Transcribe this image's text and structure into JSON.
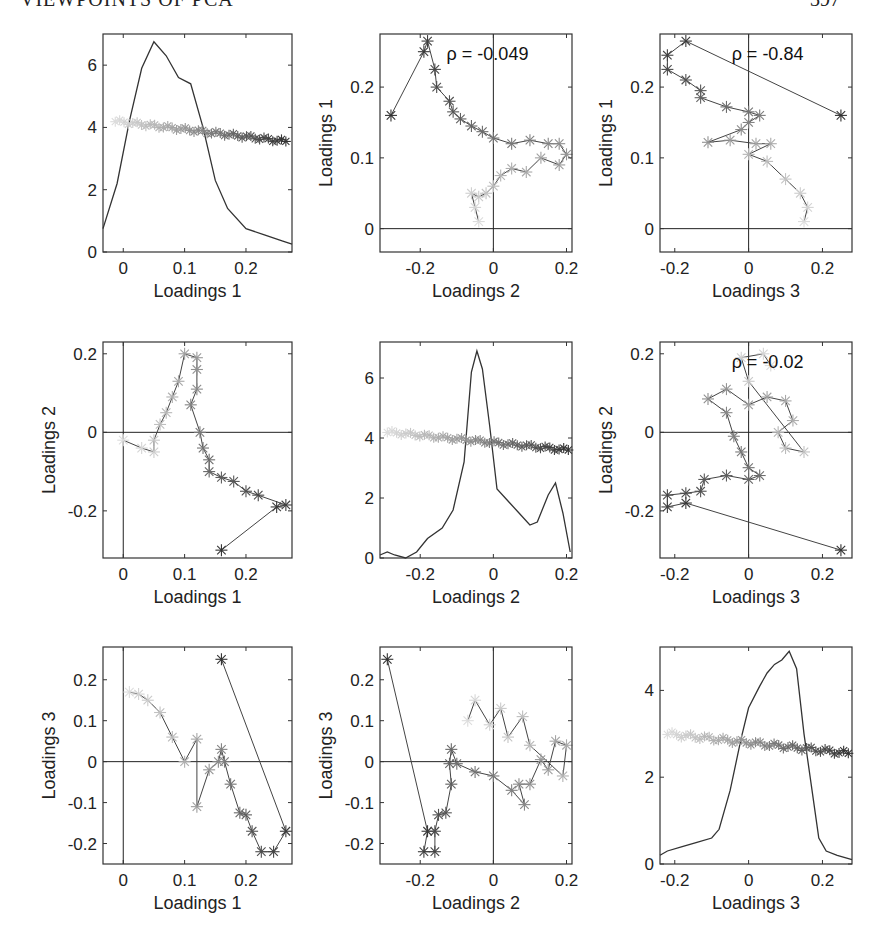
{
  "page": {
    "header": "VIEWPOINTS OF PCA",
    "page_number": "397"
  },
  "chart_data": [
    {
      "id": "p11",
      "type": "line+scatter",
      "title": "",
      "xlabel": "Loadings 1",
      "ylabel": "",
      "xlim": [
        -0.033,
        0.275
      ],
      "ylim": [
        0,
        7
      ],
      "xticks": [
        0,
        0.1,
        0.2
      ],
      "yticks": [
        0,
        2,
        4,
        6
      ],
      "density_curve": {
        "x": [
          -0.033,
          -0.01,
          0.01,
          0.03,
          0.05,
          0.07,
          0.09,
          0.11,
          0.13,
          0.15,
          0.17,
          0.2,
          0.23,
          0.26,
          0.275
        ],
        "y": [
          0.75,
          2.2,
          4.2,
          5.9,
          6.75,
          6.3,
          5.6,
          5.4,
          4.0,
          2.3,
          1.4,
          0.75,
          0.55,
          0.35,
          0.25
        ]
      },
      "trajectory_y_range": [
        3.55,
        4.2
      ],
      "trajectory_x_range": [
        0.0,
        0.27
      ],
      "rho": null
    },
    {
      "id": "p12",
      "type": "scatter",
      "xlabel": "Loadings 2",
      "ylabel": "Loadings 1",
      "xlim": [
        -0.31,
        0.215
      ],
      "ylim": [
        -0.033,
        0.275
      ],
      "xticks": [
        -0.2,
        0,
        0.2
      ],
      "yticks": [
        0,
        0.1,
        0.2
      ],
      "rho_label": "ρ = -0.049",
      "rho": -0.049,
      "points": [
        [
          -0.28,
          0.16
        ],
        [
          -0.19,
          0.25
        ],
        [
          -0.18,
          0.265
        ],
        [
          -0.16,
          0.225
        ],
        [
          -0.155,
          0.2
        ],
        [
          -0.12,
          0.18
        ],
        [
          -0.11,
          0.165
        ],
        [
          -0.09,
          0.155
        ],
        [
          -0.06,
          0.145
        ],
        [
          -0.03,
          0.137
        ],
        [
          0,
          0.128
        ],
        [
          0.05,
          0.12
        ],
        [
          0.1,
          0.125
        ],
        [
          0.15,
          0.12
        ],
        [
          0.18,
          0.12
        ],
        [
          0.2,
          0.105
        ],
        [
          0.18,
          0.09
        ],
        [
          0.13,
          0.1
        ],
        [
          0.09,
          0.08
        ],
        [
          0.05,
          0.085
        ],
        [
          0.02,
          0.075
        ],
        [
          0,
          0.06
        ],
        [
          -0.02,
          0.05
        ],
        [
          -0.04,
          0.045
        ],
        [
          -0.06,
          0.05
        ],
        [
          -0.05,
          0.03
        ],
        [
          -0.04,
          0.01
        ]
      ]
    },
    {
      "id": "p13",
      "type": "scatter",
      "xlabel": "Loadings 3",
      "ylabel": "Loadings 1",
      "xlim": [
        -0.24,
        0.28
      ],
      "ylim": [
        -0.033,
        0.275
      ],
      "xticks": [
        -0.2,
        0,
        0.2
      ],
      "yticks": [
        0,
        0.1,
        0.2
      ],
      "rho_label": "ρ = -0.84",
      "rho": -0.84,
      "points": [
        [
          0.25,
          0.16
        ],
        [
          -0.17,
          0.265
        ],
        [
          -0.22,
          0.245
        ],
        [
          -0.22,
          0.225
        ],
        [
          -0.17,
          0.21
        ],
        [
          -0.13,
          0.195
        ],
        [
          -0.13,
          0.185
        ],
        [
          -0.06,
          0.172
        ],
        [
          0,
          0.165
        ],
        [
          0.03,
          0.16
        ],
        [
          0,
          0.15
        ],
        [
          -0.02,
          0.14
        ],
        [
          -0.11,
          0.122
        ],
        [
          -0.05,
          0.125
        ],
        [
          0.02,
          0.12
        ],
        [
          0.06,
          0.12
        ],
        [
          0,
          0.105
        ],
        [
          0.05,
          0.095
        ],
        [
          0.1,
          0.07
        ],
        [
          0.14,
          0.05
        ],
        [
          0.16,
          0.03
        ],
        [
          0.15,
          0.01
        ]
      ]
    },
    {
      "id": "p21",
      "type": "scatter",
      "xlabel": "Loadings 1",
      "ylabel": "Loadings 2",
      "xlim": [
        -0.033,
        0.275
      ],
      "ylim": [
        -0.32,
        0.23
      ],
      "xticks": [
        0,
        0.1,
        0.2
      ],
      "yticks": [
        -0.2,
        0,
        0.2
      ],
      "points": [
        [
          0.16,
          -0.3
        ],
        [
          0.25,
          -0.19
        ],
        [
          0.265,
          -0.185
        ],
        [
          0.22,
          -0.16
        ],
        [
          0.2,
          -0.15
        ],
        [
          0.18,
          -0.125
        ],
        [
          0.16,
          -0.115
        ],
        [
          0.14,
          -0.1
        ],
        [
          0.14,
          -0.07
        ],
        [
          0.13,
          -0.04
        ],
        [
          0.125,
          0
        ],
        [
          0.11,
          0.07
        ],
        [
          0.12,
          0.11
        ],
        [
          0.12,
          0.16
        ],
        [
          0.12,
          0.19
        ],
        [
          0.1,
          0.2
        ],
        [
          0.09,
          0.13
        ],
        [
          0.08,
          0.09
        ],
        [
          0.07,
          0.05
        ],
        [
          0.06,
          0.02
        ],
        [
          0.05,
          -0.02
        ],
        [
          0.05,
          -0.05
        ],
        [
          0.03,
          -0.04
        ],
        [
          0.0,
          -0.02
        ]
      ]
    },
    {
      "id": "p22",
      "type": "line+scatter",
      "xlabel": "Loadings 2",
      "ylabel": "",
      "xlim": [
        -0.31,
        0.215
      ],
      "ylim": [
        0,
        7.2
      ],
      "xticks": [
        -0.2,
        0,
        0.2
      ],
      "yticks": [
        0,
        2,
        4,
        6
      ],
      "density_curve": {
        "x": [
          -0.31,
          -0.29,
          -0.27,
          -0.24,
          -0.21,
          -0.18,
          -0.14,
          -0.11,
          -0.08,
          -0.06,
          -0.045,
          -0.03,
          -0.01,
          0.01,
          0.04,
          0.07,
          0.1,
          0.12,
          0.15,
          0.17,
          0.19,
          0.21
        ],
        "y": [
          0.1,
          0.2,
          0.1,
          0.0,
          0.2,
          0.65,
          1.0,
          1.6,
          3.2,
          6.2,
          6.9,
          6.3,
          4.4,
          2.3,
          1.9,
          1.5,
          1.1,
          1.2,
          2.1,
          2.5,
          1.5,
          0.2
        ]
      },
      "trajectory_y_range": [
        3.6,
        4.2
      ]
    },
    {
      "id": "p23",
      "type": "scatter",
      "xlabel": "Loadings 3",
      "ylabel": "Loadings 2",
      "xlim": [
        -0.24,
        0.28
      ],
      "ylim": [
        -0.32,
        0.23
      ],
      "xticks": [
        -0.2,
        0,
        0.2
      ],
      "yticks": [
        -0.2,
        0,
        0.2
      ],
      "rho_label": "ρ = -0.02",
      "rho": -0.02,
      "points": [
        [
          0.25,
          -0.3
        ],
        [
          -0.17,
          -0.18
        ],
        [
          -0.22,
          -0.19
        ],
        [
          -0.22,
          -0.16
        ],
        [
          -0.17,
          -0.155
        ],
        [
          -0.13,
          -0.15
        ],
        [
          -0.12,
          -0.12
        ],
        [
          -0.06,
          -0.11
        ],
        [
          0,
          -0.12
        ],
        [
          0.03,
          -0.11
        ],
        [
          0,
          -0.09
        ],
        [
          -0.02,
          -0.05
        ],
        [
          -0.04,
          -0.01
        ],
        [
          -0.06,
          0.05
        ],
        [
          -0.11,
          0.085
        ],
        [
          -0.06,
          0.11
        ],
        [
          0,
          0.07
        ],
        [
          0.05,
          0.09
        ],
        [
          0.1,
          0.08
        ],
        [
          0.12,
          0.03
        ],
        [
          0.08,
          0.0
        ],
        [
          0.1,
          -0.04
        ],
        [
          0.15,
          -0.05
        ],
        [
          0.0,
          0.13
        ],
        [
          -0.02,
          0.19
        ],
        [
          0.04,
          0.2
        ],
        [
          0.06,
          0.17
        ]
      ]
    },
    {
      "id": "p31",
      "type": "scatter",
      "xlabel": "Loadings 1",
      "ylabel": "Loadings 3",
      "xlim": [
        -0.033,
        0.275
      ],
      "ylim": [
        -0.25,
        0.28
      ],
      "xticks": [
        0,
        0.1,
        0.2
      ],
      "yticks": [
        -0.2,
        -0.1,
        0,
        0.1,
        0.2
      ],
      "points": [
        [
          0.16,
          0.25
        ],
        [
          0.265,
          -0.17
        ],
        [
          0.245,
          -0.22
        ],
        [
          0.225,
          -0.22
        ],
        [
          0.21,
          -0.17
        ],
        [
          0.2,
          -0.13
        ],
        [
          0.19,
          -0.125
        ],
        [
          0.175,
          -0.055
        ],
        [
          0.165,
          0
        ],
        [
          0.16,
          0.03
        ],
        [
          0.155,
          0
        ],
        [
          0.14,
          -0.02
        ],
        [
          0.12,
          -0.11
        ],
        [
          0.12,
          0.055
        ],
        [
          0.1,
          0.0
        ],
        [
          0.08,
          0.06
        ],
        [
          0.06,
          0.12
        ],
        [
          0.04,
          0.15
        ],
        [
          0.025,
          0.165
        ],
        [
          0.01,
          0.17
        ]
      ]
    },
    {
      "id": "p32",
      "type": "scatter",
      "xlabel": "Loadings 2",
      "ylabel": "Loadings 3",
      "xlim": [
        -0.31,
        0.215
      ],
      "ylim": [
        -0.25,
        0.28
      ],
      "xticks": [
        -0.2,
        0,
        0.2
      ],
      "yticks": [
        -0.2,
        -0.1,
        0,
        0.1,
        0.2
      ],
      "points": [
        [
          -0.29,
          0.25
        ],
        [
          -0.18,
          -0.17
        ],
        [
          -0.19,
          -0.22
        ],
        [
          -0.16,
          -0.22
        ],
        [
          -0.16,
          -0.17
        ],
        [
          -0.15,
          -0.13
        ],
        [
          -0.13,
          -0.125
        ],
        [
          -0.115,
          -0.055
        ],
        [
          -0.12,
          -0.005
        ],
        [
          -0.115,
          0.03
        ],
        [
          -0.1,
          -0.005
        ],
        [
          -0.05,
          -0.025
        ],
        [
          0,
          -0.035
        ],
        [
          0.05,
          -0.07
        ],
        [
          0.085,
          -0.105
        ],
        [
          0.07,
          -0.055
        ],
        [
          0.1,
          -0.055
        ],
        [
          0.13,
          0.005
        ],
        [
          0.15,
          -0.02
        ],
        [
          0.17,
          0.05
        ],
        [
          0.2,
          0.04
        ],
        [
          0.19,
          -0.035
        ],
        [
          0.1,
          0.04
        ],
        [
          0.08,
          0.11
        ],
        [
          0.04,
          0.06
        ],
        [
          0.02,
          0.13
        ],
        [
          -0.01,
          0.09
        ],
        [
          -0.05,
          0.15
        ],
        [
          -0.07,
          0.1
        ]
      ]
    },
    {
      "id": "p33",
      "type": "line+scatter",
      "xlabel": "Loadings 3",
      "ylabel": "",
      "xlim": [
        -0.24,
        0.28
      ],
      "ylim": [
        0,
        5.0
      ],
      "xticks": [
        -0.2,
        0,
        0.2
      ],
      "yticks": [
        0,
        2,
        4
      ],
      "density_curve": {
        "x": [
          -0.24,
          -0.22,
          -0.18,
          -0.14,
          -0.1,
          -0.08,
          -0.05,
          -0.02,
          0.0,
          0.03,
          0.05,
          0.07,
          0.09,
          0.11,
          0.13,
          0.15,
          0.17,
          0.19,
          0.21,
          0.24,
          0.28
        ],
        "y": [
          0.2,
          0.3,
          0.4,
          0.5,
          0.6,
          0.8,
          1.7,
          2.9,
          3.6,
          4.1,
          4.4,
          4.6,
          4.7,
          4.9,
          4.5,
          3.0,
          1.8,
          0.6,
          0.3,
          0.2,
          0.1
        ]
      },
      "trajectory_y_range": [
        2.55,
        3.0
      ]
    }
  ]
}
